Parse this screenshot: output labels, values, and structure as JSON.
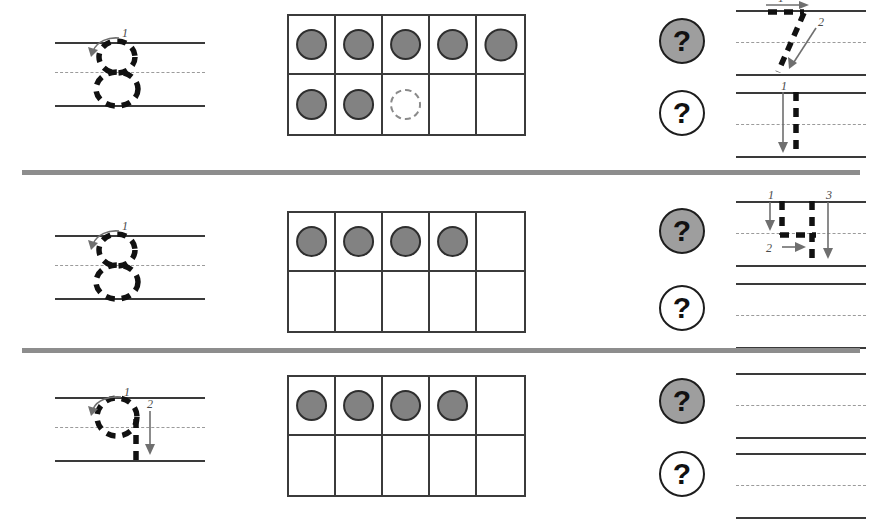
{
  "worksheet": {
    "title": "Number Tracing and Ten-Frame Counting Worksheet",
    "colors": {
      "counter_fill": "#828282",
      "counter_outline": "#2e2e2e",
      "dashed_counter_outline": "#8a8a8a",
      "row_divider": "#8d8d8d",
      "guide_solid_line": "#3a3a3a",
      "guide_dashed_line": "#9b9b9b",
      "badge_gray": "#9e9e9e",
      "badge_white": "#ffffff",
      "frame_border": "#3b3b3b"
    },
    "badge_symbol": "?",
    "rows": [
      {
        "id": "row-1",
        "trace_guide": {
          "numeral": "8",
          "stroke_count": 1,
          "stroke_labels": [
            "1"
          ],
          "style": "dashed-outline"
        },
        "ten_frame": {
          "columns": 5,
          "rows": 2,
          "filled_count": 7,
          "dashed_count": 1,
          "empty_count": 2,
          "top_row": [
            "filled",
            "filled",
            "filled",
            "filled",
            "filled"
          ],
          "bottom_row": [
            "filled",
            "filled",
            "dashed",
            "empty",
            "empty"
          ]
        },
        "badges": [
          {
            "label": "?",
            "style": "gray"
          },
          {
            "label": "?",
            "style": "white"
          }
        ],
        "practice": [
          {
            "numeral": "7",
            "stroke_count": 2,
            "stroke_labels": [
              "1",
              "2"
            ],
            "filled": true
          },
          {
            "numeral": "1",
            "stroke_count": 1,
            "stroke_labels": [
              "1"
            ],
            "filled": true
          }
        ]
      },
      {
        "id": "row-2",
        "trace_guide": {
          "numeral": "8",
          "stroke_count": 1,
          "stroke_labels": [
            "1"
          ],
          "style": "dashed-outline"
        },
        "ten_frame": {
          "columns": 5,
          "rows": 2,
          "filled_count": 4,
          "dashed_count": 0,
          "empty_count": 6,
          "top_row": [
            "filled",
            "filled",
            "filled",
            "filled",
            "empty"
          ],
          "bottom_row": [
            "empty",
            "empty",
            "empty",
            "empty",
            "empty"
          ]
        },
        "badges": [
          {
            "label": "?",
            "style": "gray"
          },
          {
            "label": "?",
            "style": "white"
          }
        ],
        "practice": [
          {
            "numeral": "4",
            "stroke_count": 3,
            "stroke_labels": [
              "1",
              "2",
              "3"
            ],
            "filled": true
          },
          {
            "numeral": "",
            "stroke_count": 0,
            "stroke_labels": [],
            "filled": false
          }
        ]
      },
      {
        "id": "row-3",
        "trace_guide": {
          "numeral": "9",
          "stroke_count": 2,
          "stroke_labels": [
            "1",
            "2"
          ],
          "style": "dashed-outline"
        },
        "ten_frame": {
          "columns": 5,
          "rows": 2,
          "filled_count": 4,
          "dashed_count": 0,
          "empty_count": 6,
          "top_row": [
            "filled",
            "filled",
            "filled",
            "filled",
            "empty"
          ],
          "bottom_row": [
            "empty",
            "empty",
            "empty",
            "empty",
            "empty"
          ]
        },
        "badges": [
          {
            "label": "?",
            "style": "gray"
          },
          {
            "label": "?",
            "style": "white"
          }
        ],
        "practice": [
          {
            "numeral": "",
            "stroke_count": 0,
            "stroke_labels": [],
            "filled": false
          },
          {
            "numeral": "",
            "stroke_count": 0,
            "stroke_labels": [],
            "filled": false
          }
        ]
      }
    ]
  }
}
